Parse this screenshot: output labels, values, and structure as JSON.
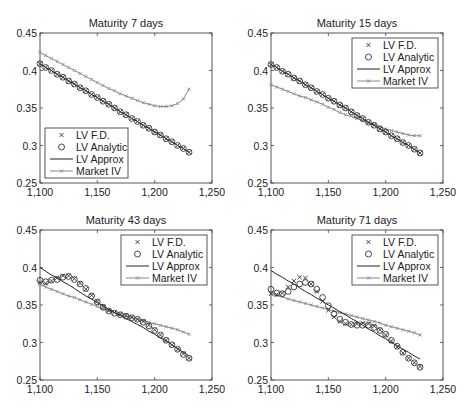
{
  "figure": {
    "width": 473,
    "height": 411
  },
  "chart_data": [
    {
      "type": "line",
      "title": "Maturity 7 days",
      "xlabel": "",
      "ylabel": "",
      "xlim": [
        1100,
        1250
      ],
      "ylim": [
        0.25,
        0.45
      ],
      "xticks": [
        "1,100",
        "1,150",
        "1,200",
        "1,250"
      ],
      "yticks": [
        "0.25",
        "0.3",
        "0.35",
        "0.4",
        "0.45"
      ],
      "grid": false,
      "legend_position": "lower left",
      "legend": [
        "LV F.D.",
        "LV Analytic",
        "LV Approx",
        "Market IV"
      ],
      "x": [
        1100,
        1105,
        1110,
        1115,
        1120,
        1125,
        1130,
        1135,
        1140,
        1145,
        1150,
        1155,
        1160,
        1165,
        1170,
        1175,
        1180,
        1185,
        1190,
        1195,
        1200,
        1205,
        1210,
        1215,
        1220,
        1225,
        1230
      ],
      "series": [
        {
          "name": "LV F.D.",
          "values": [
            0.409,
            0.404,
            0.4,
            0.395,
            0.391,
            0.386,
            0.382,
            0.377,
            0.373,
            0.368,
            0.364,
            0.359,
            0.355,
            0.35,
            0.345,
            0.341,
            0.336,
            0.332,
            0.327,
            0.323,
            0.318,
            0.314,
            0.309,
            0.305,
            0.3,
            0.296,
            0.291
          ]
        },
        {
          "name": "LV Analytic",
          "values": [
            0.409,
            0.404,
            0.4,
            0.395,
            0.391,
            0.386,
            0.382,
            0.377,
            0.373,
            0.368,
            0.364,
            0.359,
            0.355,
            0.35,
            0.345,
            0.341,
            0.336,
            0.332,
            0.327,
            0.323,
            0.318,
            0.314,
            0.309,
            0.305,
            0.3,
            0.296,
            0.291
          ]
        },
        {
          "name": "LV Approx",
          "values": [
            0.409,
            0.404,
            0.4,
            0.395,
            0.391,
            0.386,
            0.382,
            0.377,
            0.373,
            0.368,
            0.364,
            0.359,
            0.355,
            0.35,
            0.345,
            0.341,
            0.336,
            0.332,
            0.327,
            0.323,
            0.318,
            0.314,
            0.309,
            0.305,
            0.3,
            0.296,
            0.291
          ]
        },
        {
          "name": "Market IV",
          "values": [
            0.424,
            0.42,
            0.416,
            0.412,
            0.408,
            0.404,
            0.4,
            0.396,
            0.392,
            0.388,
            0.384,
            0.38,
            0.376,
            0.373,
            0.369,
            0.366,
            0.363,
            0.36,
            0.357,
            0.355,
            0.353,
            0.352,
            0.352,
            0.353,
            0.356,
            0.362,
            0.375
          ]
        }
      ]
    },
    {
      "type": "line",
      "title": "Maturity 15 days",
      "xlabel": "",
      "ylabel": "",
      "xlim": [
        1100,
        1250
      ],
      "ylim": [
        0.25,
        0.45
      ],
      "xticks": [
        "1,100",
        "1,150",
        "1,200",
        "1,250"
      ],
      "yticks": [
        "0.25",
        "0.3",
        "0.35",
        "0.4",
        "0.45"
      ],
      "grid": false,
      "legend_position": "upper right",
      "legend": [
        "LV F.D.",
        "LV Analytic",
        "LV Approx",
        "Market IV"
      ],
      "x": [
        1100,
        1105,
        1110,
        1115,
        1120,
        1125,
        1130,
        1135,
        1140,
        1145,
        1150,
        1155,
        1160,
        1165,
        1170,
        1175,
        1180,
        1185,
        1190,
        1195,
        1200,
        1205,
        1210,
        1215,
        1220,
        1225,
        1230
      ],
      "series": [
        {
          "name": "LV F.D.",
          "values": [
            0.408,
            0.404,
            0.399,
            0.395,
            0.39,
            0.386,
            0.381,
            0.377,
            0.372,
            0.368,
            0.363,
            0.359,
            0.354,
            0.35,
            0.345,
            0.34,
            0.336,
            0.331,
            0.327,
            0.322,
            0.318,
            0.313,
            0.309,
            0.304,
            0.3,
            0.295,
            0.29
          ]
        },
        {
          "name": "LV Analytic",
          "values": [
            0.408,
            0.404,
            0.399,
            0.395,
            0.39,
            0.386,
            0.381,
            0.377,
            0.372,
            0.368,
            0.363,
            0.359,
            0.354,
            0.35,
            0.345,
            0.34,
            0.336,
            0.331,
            0.327,
            0.322,
            0.318,
            0.313,
            0.309,
            0.304,
            0.3,
            0.295,
            0.29
          ]
        },
        {
          "name": "LV Approx",
          "values": [
            0.408,
            0.404,
            0.399,
            0.395,
            0.39,
            0.386,
            0.381,
            0.377,
            0.372,
            0.368,
            0.363,
            0.359,
            0.354,
            0.35,
            0.345,
            0.34,
            0.336,
            0.331,
            0.327,
            0.322,
            0.318,
            0.313,
            0.309,
            0.304,
            0.3,
            0.295,
            0.29
          ]
        },
        {
          "name": "Market IV",
          "values": [
            0.381,
            0.378,
            0.375,
            0.372,
            0.369,
            0.366,
            0.364,
            0.361,
            0.358,
            0.355,
            0.351,
            0.348,
            0.344,
            0.341,
            0.339,
            0.336,
            0.333,
            0.33,
            0.328,
            0.325,
            0.322,
            0.32,
            0.318,
            0.316,
            0.314,
            0.313,
            0.313
          ]
        }
      ]
    },
    {
      "type": "line",
      "title": "Maturity 43 days",
      "xlabel": "",
      "ylabel": "",
      "xlim": [
        1100,
        1250
      ],
      "ylim": [
        0.25,
        0.45
      ],
      "xticks": [
        "1,100",
        "1,150",
        "1,200",
        "1,250"
      ],
      "yticks": [
        "0.25",
        "0.3",
        "0.35",
        "0.4",
        "0.45"
      ],
      "grid": false,
      "legend_position": "upper right",
      "legend": [
        "LV F.D.",
        "LV Analytic",
        "LV Approx",
        "Market IV"
      ],
      "x": [
        1100,
        1105,
        1110,
        1115,
        1120,
        1125,
        1130,
        1135,
        1140,
        1145,
        1150,
        1155,
        1160,
        1165,
        1170,
        1175,
        1180,
        1185,
        1190,
        1195,
        1200,
        1205,
        1210,
        1215,
        1220,
        1225,
        1230
      ],
      "series": [
        {
          "name": "LV F.D.",
          "values": [
            0.38,
            0.379,
            0.382,
            0.386,
            0.389,
            0.389,
            0.385,
            0.379,
            0.371,
            0.363,
            0.355,
            0.348,
            0.343,
            0.34,
            0.338,
            0.336,
            0.334,
            0.331,
            0.328,
            0.323,
            0.317,
            0.31,
            0.303,
            0.297,
            0.291,
            0.285,
            0.279
          ]
        },
        {
          "name": "LV Analytic",
          "values": [
            0.383,
            0.381,
            0.383,
            0.384,
            0.387,
            0.388,
            0.384,
            0.378,
            0.372,
            0.362,
            0.354,
            0.347,
            0.342,
            0.339,
            0.337,
            0.335,
            0.333,
            0.331,
            0.327,
            0.322,
            0.316,
            0.31,
            0.303,
            0.297,
            0.291,
            0.284,
            0.279
          ]
        },
        {
          "name": "LV Approx",
          "values": [
            0.4,
            0.395,
            0.39,
            0.386,
            0.381,
            0.377,
            0.372,
            0.367,
            0.362,
            0.358,
            0.353,
            0.349,
            0.344,
            0.34,
            0.336,
            0.332,
            0.328,
            0.324,
            0.32,
            0.315,
            0.311,
            0.306,
            0.302,
            0.297,
            0.292,
            0.287,
            0.282
          ]
        },
        {
          "name": "Market IV",
          "values": [
            0.377,
            0.374,
            0.371,
            0.368,
            0.365,
            0.362,
            0.36,
            0.357,
            0.354,
            0.351,
            0.348,
            0.345,
            0.342,
            0.34,
            0.337,
            0.335,
            0.333,
            0.331,
            0.329,
            0.327,
            0.325,
            0.323,
            0.321,
            0.319,
            0.317,
            0.314,
            0.311
          ]
        }
      ]
    },
    {
      "type": "line",
      "title": "Maturity 71 days",
      "xlabel": "",
      "ylabel": "",
      "xlim": [
        1100,
        1250
      ],
      "ylim": [
        0.25,
        0.45
      ],
      "xticks": [
        "1,100",
        "1,150",
        "1,200",
        "1,250"
      ],
      "yticks": [
        "0.25",
        "0.3",
        "0.35",
        "0.4",
        "0.45"
      ],
      "grid": false,
      "legend_position": "upper right",
      "legend": [
        "LV F.D.",
        "LV Analytic",
        "LV Approx",
        "Market IV"
      ],
      "x": [
        1100,
        1105,
        1110,
        1115,
        1120,
        1125,
        1130,
        1135,
        1140,
        1145,
        1150,
        1155,
        1160,
        1165,
        1170,
        1175,
        1180,
        1185,
        1190,
        1195,
        1200,
        1205,
        1210,
        1215,
        1220,
        1225,
        1230
      ],
      "series": [
        {
          "name": "LV F.D.",
          "values": [
            0.365,
            0.364,
            0.366,
            0.374,
            0.382,
            0.387,
            0.386,
            0.378,
            0.368,
            0.355,
            0.343,
            0.334,
            0.328,
            0.325,
            0.324,
            0.325,
            0.326,
            0.325,
            0.322,
            0.317,
            0.31,
            0.302,
            0.294,
            0.286,
            0.279,
            0.273,
            0.268
          ]
        },
        {
          "name": "LV Analytic",
          "values": [
            0.371,
            0.366,
            0.365,
            0.368,
            0.374,
            0.378,
            0.38,
            0.378,
            0.371,
            0.36,
            0.349,
            0.338,
            0.331,
            0.327,
            0.324,
            0.323,
            0.323,
            0.323,
            0.32,
            0.316,
            0.311,
            0.303,
            0.295,
            0.287,
            0.279,
            0.273,
            0.267
          ]
        },
        {
          "name": "LV Approx",
          "values": [
            0.396,
            0.391,
            0.387,
            0.382,
            0.378,
            0.373,
            0.368,
            0.364,
            0.359,
            0.355,
            0.35,
            0.346,
            0.341,
            0.337,
            0.332,
            0.328,
            0.323,
            0.318,
            0.314,
            0.309,
            0.305,
            0.3,
            0.296,
            0.291,
            0.287,
            0.282,
            0.278
          ]
        },
        {
          "name": "Market IV",
          "values": [
            0.366,
            0.363,
            0.361,
            0.358,
            0.356,
            0.354,
            0.352,
            0.35,
            0.348,
            0.346,
            0.344,
            0.342,
            0.34,
            0.338,
            0.336,
            0.334,
            0.332,
            0.33,
            0.328,
            0.326,
            0.323,
            0.321,
            0.319,
            0.317,
            0.315,
            0.313,
            0.31
          ]
        }
      ]
    }
  ],
  "layout": {
    "axes": [
      {
        "left": 40,
        "top": 33,
        "right": 212,
        "bottom": 183,
        "legend_box": {
          "x": 45,
          "y": 128,
          "w": 83,
          "h": 50
        }
      },
      {
        "left": 271,
        "top": 33,
        "right": 443,
        "bottom": 183,
        "legend_box": {
          "x": 352,
          "y": 38,
          "w": 86,
          "h": 50
        }
      },
      {
        "left": 40,
        "top": 230,
        "right": 212,
        "bottom": 380,
        "legend_box": {
          "x": 121,
          "y": 235,
          "w": 86,
          "h": 50
        }
      },
      {
        "left": 271,
        "top": 230,
        "right": 443,
        "bottom": 380,
        "legend_box": {
          "x": 352,
          "y": 235,
          "w": 86,
          "h": 50
        }
      }
    ],
    "colors": {
      "axis": "#444444",
      "lv_fd": "#333333",
      "lv_analytic": "#333333",
      "lv_approx": "#222222",
      "market_iv": "#8a8a8a"
    }
  }
}
